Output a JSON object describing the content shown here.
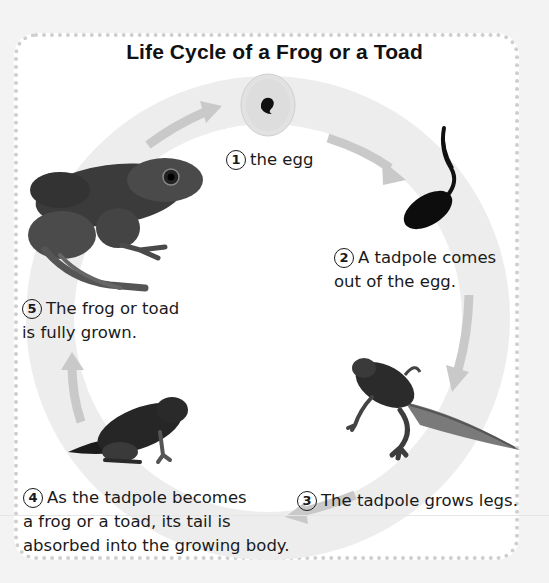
{
  "title": "Life Cycle of a Frog or a Toad",
  "colors": {
    "background": "#f3f3f3",
    "panel": "#ffffff",
    "border_dots": "#cfcfcf",
    "ring": "#ececec",
    "arrows": "#c9c9c9",
    "text": "#1a1a1a"
  },
  "stages": [
    {
      "number": "1",
      "lines": [
        "the egg"
      ],
      "image": "egg-icon"
    },
    {
      "number": "2",
      "lines": [
        "A tadpole comes",
        "out of the egg."
      ],
      "image": "tadpole-icon"
    },
    {
      "number": "3",
      "lines": [
        "The tadpole grows legs."
      ],
      "image": "tadpole-with-legs-icon"
    },
    {
      "number": "4",
      "lines": [
        "As the tadpole becomes",
        "a frog or a toad, its tail is",
        "absorbed into the growing body."
      ],
      "image": "froglet-icon"
    },
    {
      "number": "5",
      "lines": [
        "The frog or toad",
        "is fully grown."
      ],
      "image": "adult-frog-icon"
    }
  ]
}
